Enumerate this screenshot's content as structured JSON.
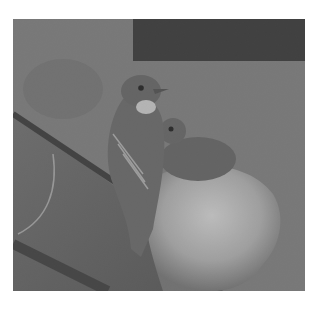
{
  "image": {
    "subject": "Bird perched beside a nest with a chick, black and white photo",
    "colors": {
      "background": "#ffffff",
      "wall": "#747474",
      "dark_panel": "#2a2a2a",
      "beam": "#555555",
      "nest": "#b5b5b5",
      "bird": "#5e5e5e"
    }
  }
}
